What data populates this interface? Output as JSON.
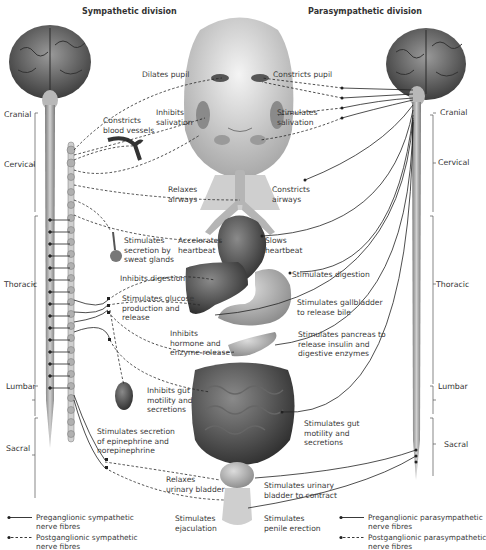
{
  "titles": {
    "sympathetic": "Sympathetic division",
    "parasympathetic": "Parasympathetic division"
  },
  "regions_left": [
    "Cranial",
    "Cervical",
    "Thoracic",
    "Lumbar",
    "Sacral"
  ],
  "regions_right": [
    "Cranial",
    "Cervical",
    "Thoracic",
    "Lumbar",
    "Sacral"
  ],
  "sympathetic_effects": [
    "Dilates pupil",
    "Inhibits\nsalivation",
    "Constricts\nblood vessels",
    "Relaxes\nairways",
    "Accelerates\nheartbeat",
    "Stimulates\nsecretion by\nsweat glands",
    "Inhibits digestion",
    "Stimulates glucose\nproduction and\nrelease",
    "Inhibits\nhormone and\nenzyme release",
    "Inhibits gut\nmotility and\nsecretions",
    "Stimulates secretion\nof epinephrine and\nnorepinephrine",
    "Relaxes\nurinary bladder",
    "Stimulates\nejaculation"
  ],
  "parasympathetic_effects": [
    "Constricts pupil",
    "Stimulates\nsalivation",
    "Constricts\nairways",
    "Slows\nheartbeat",
    "Stimulates digestion",
    "Stimulates gallbladder\nto release bile",
    "Stimulates pancreas to\nrelease insulin and\ndigestive enzymes",
    "Stimulates gut\nmotility and\nsecretions",
    "Stimulates urinary\nbladder to contract",
    "Stimulates\npenile erection"
  ],
  "legend_left": [
    {
      "style": "solid",
      "label": "Preganglionic sympathetic\nnerve fibres"
    },
    {
      "style": "dashed",
      "label": "Postganglionic sympathetic\nnerve fibres"
    }
  ],
  "legend_right": [
    {
      "style": "solid",
      "label": "Preganglionic parasympathetic\nnerve fibres"
    },
    {
      "style": "dashed",
      "label": "Postganglionic parasympathetic\nnerve fibres"
    }
  ],
  "colors": {
    "nerve": "#222222",
    "organ_dark": "#4a4a4a",
    "organ_mid": "#8a8a8a",
    "organ_light": "#c8c8c8",
    "spine": "#a0a0a0"
  }
}
